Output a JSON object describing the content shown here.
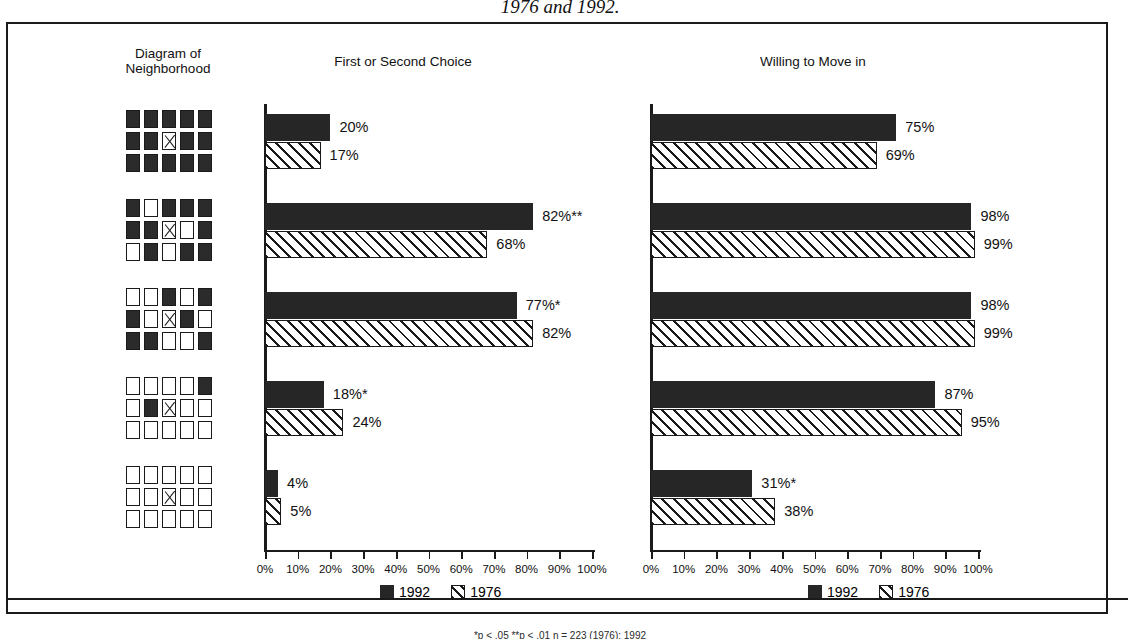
{
  "caption_top": "1976 and 1992.",
  "footnote": "*p < .05  **p < .01     n = 223 (1976); 1992",
  "headers": {
    "diagram": "Diagram of\nNeighborhood",
    "diagram_line1": "Diagram of",
    "diagram_line2": "Neighborhood",
    "left_chart": "First or Second Choice",
    "right_chart": "Willing to Move in"
  },
  "legend": {
    "items": [
      {
        "key": "1992",
        "label": "1992",
        "swatch": "solid-black-square"
      },
      {
        "key": "1976",
        "label": "1976",
        "swatch": "hatched-square"
      }
    ]
  },
  "axis": {
    "ticks": [
      "0%",
      "10%",
      "20%",
      "30%",
      "40%",
      "50%",
      "60%",
      "70%",
      "80%",
      "90%",
      "100%"
    ],
    "min": 0,
    "max": 100
  },
  "diagrams": [
    {
      "name": "diagram-all-black",
      "grid": [
        [
          "b",
          "b",
          "b",
          "b",
          "b"
        ],
        [
          "b",
          "b",
          "x",
          "b",
          "b"
        ],
        [
          "b",
          "b",
          "b",
          "b",
          "b"
        ]
      ]
    },
    {
      "name": "diagram-mostly-black",
      "grid": [
        [
          "b",
          "w",
          "b",
          "b",
          "b"
        ],
        [
          "b",
          "b",
          "x",
          "w",
          "b"
        ],
        [
          "w",
          "b",
          "w",
          "b",
          "b"
        ]
      ]
    },
    {
      "name": "diagram-mixed",
      "grid": [
        [
          "w",
          "w",
          "b",
          "w",
          "b"
        ],
        [
          "b",
          "w",
          "x",
          "b",
          "w"
        ],
        [
          "b",
          "b",
          "w",
          "w",
          "b"
        ]
      ]
    },
    {
      "name": "diagram-mostly-white",
      "grid": [
        [
          "w",
          "w",
          "w",
          "w",
          "b"
        ],
        [
          "w",
          "b",
          "x",
          "w",
          "w"
        ],
        [
          "w",
          "w",
          "w",
          "w",
          "w"
        ]
      ]
    },
    {
      "name": "diagram-all-white",
      "grid": [
        [
          "w",
          "w",
          "w",
          "w",
          "w"
        ],
        [
          "w",
          "w",
          "x",
          "w",
          "w"
        ],
        [
          "w",
          "w",
          "w",
          "w",
          "w"
        ]
      ]
    }
  ],
  "chart_data": [
    {
      "type": "bar",
      "title": "First or Second Choice",
      "orientation": "horizontal",
      "categories": [
        "all-black",
        "mostly-black",
        "mixed",
        "mostly-white",
        "all-white"
      ],
      "xlabel": "",
      "ylabel": "",
      "xlim": [
        0,
        100
      ],
      "grid": false,
      "legend_position": "bottom-center",
      "series": [
        {
          "name": "1992",
          "values": [
            20,
            82,
            77,
            18,
            4
          ],
          "labels": [
            "20%",
            "82%**",
            "77%*",
            "18%*",
            "4%"
          ]
        },
        {
          "name": "1976",
          "values": [
            17,
            68,
            82,
            24,
            5
          ],
          "labels": [
            "17%",
            "68%",
            "82%",
            "24%",
            "5%"
          ]
        }
      ]
    },
    {
      "type": "bar",
      "title": "Willing to Move in",
      "orientation": "horizontal",
      "categories": [
        "all-black",
        "mostly-black",
        "mixed",
        "mostly-white",
        "all-white"
      ],
      "xlabel": "",
      "ylabel": "",
      "xlim": [
        0,
        100
      ],
      "grid": false,
      "legend_position": "bottom-center",
      "series": [
        {
          "name": "1992",
          "values": [
            75,
            98,
            98,
            87,
            31
          ],
          "labels": [
            "75%",
            "98%",
            "98%",
            "87%",
            "31%*"
          ]
        },
        {
          "name": "1976",
          "values": [
            69,
            99,
            99,
            95,
            38
          ],
          "labels": [
            "69%",
            "99%",
            "99%",
            "95%",
            "38%"
          ]
        }
      ]
    }
  ]
}
